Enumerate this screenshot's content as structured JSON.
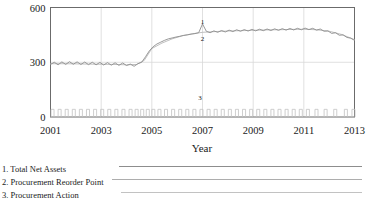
{
  "chart_data": {
    "type": "line",
    "title": "",
    "xlabel": "Year",
    "ylabel": "",
    "xlim": [
      2001,
      2013
    ],
    "ylim": [
      0,
      600
    ],
    "ytick_labels": [
      "600",
      "300",
      "0"
    ],
    "ytick_values": [
      600,
      300,
      0
    ],
    "xtick_labels": [
      "2001",
      "2003",
      "2005",
      "2007",
      "2009",
      "2011",
      "2013"
    ],
    "xtick_values": [
      2001,
      2003,
      2005,
      2007,
      2009,
      2011,
      2013
    ],
    "grid": true,
    "legend_position": "below-plot",
    "annotations": [
      {
        "text": "1",
        "x": 2007.0,
        "y": 510
      },
      {
        "text": "2",
        "x": 2007.0,
        "y": 418
      },
      {
        "text": "3",
        "x": 2006.9,
        "y": 92
      }
    ],
    "series": [
      {
        "name": "Total Net Assets",
        "legend_index": "1",
        "color": "#8d8d8d",
        "x": [
          2001.0,
          2001.15,
          2001.3,
          2001.45,
          2001.6,
          2001.75,
          2001.9,
          2002.05,
          2002.2,
          2002.35,
          2002.5,
          2002.65,
          2002.8,
          2002.95,
          2003.1,
          2003.25,
          2003.4,
          2003.55,
          2003.7,
          2003.85,
          2004.0,
          2004.15,
          2004.3,
          2004.45,
          2004.6,
          2004.75,
          2004.9,
          2005.05,
          2005.2,
          2005.35,
          2005.5,
          2005.65,
          2005.8,
          2005.95,
          2006.1,
          2006.25,
          2006.4,
          2006.55,
          2006.7,
          2006.85,
          2007.0,
          2007.15,
          2007.3,
          2007.45,
          2007.6,
          2007.75,
          2007.9,
          2008.05,
          2008.2,
          2008.35,
          2008.5,
          2008.65,
          2008.8,
          2008.95,
          2009.1,
          2009.25,
          2009.4,
          2009.55,
          2009.7,
          2009.85,
          2010.0,
          2010.15,
          2010.3,
          2010.45,
          2010.6,
          2010.75,
          2010.9,
          2011.05,
          2011.2,
          2011.35,
          2011.5,
          2011.65,
          2011.8,
          2011.95,
          2012.1,
          2012.25,
          2012.4,
          2012.55,
          2012.7,
          2012.85,
          2013.0
        ],
        "y": [
          288,
          300,
          286,
          302,
          288,
          303,
          289,
          302,
          288,
          301,
          287,
          300,
          286,
          299,
          285,
          298,
          284,
          297,
          283,
          296,
          282,
          290,
          278,
          292,
          300,
          330,
          362,
          385,
          400,
          410,
          420,
          428,
          433,
          438,
          442,
          447,
          450,
          454,
          457,
          462,
          510,
          470,
          462,
          472,
          464,
          474,
          466,
          476,
          468,
          478,
          470,
          479,
          471,
          480,
          472,
          481,
          473,
          482,
          474,
          483,
          475,
          484,
          476,
          485,
          477,
          486,
          478,
          487,
          479,
          486,
          476,
          482,
          470,
          472,
          458,
          462,
          448,
          450,
          436,
          432,
          420
        ]
      },
      {
        "name": "Procurement Reorder Point",
        "legend_index": "2",
        "color": "#b0b0b0",
        "x": [
          2001.0,
          2001.5,
          2002.0,
          2002.5,
          2003.0,
          2003.5,
          2004.0,
          2004.4,
          2004.7,
          2005.0,
          2005.4,
          2005.8,
          2006.2,
          2006.6,
          2007.0,
          2007.5,
          2008.0,
          2008.5,
          2009.0,
          2009.5,
          2010.0,
          2010.5,
          2011.0,
          2011.5,
          2012.0,
          2012.5,
          2013.0
        ],
        "y": [
          292,
          292,
          291,
          290,
          289,
          288,
          286,
          288,
          310,
          375,
          405,
          428,
          445,
          456,
          464,
          468,
          471,
          473,
          475,
          477,
          478,
          480,
          481,
          478,
          470,
          452,
          424
        ]
      },
      {
        "name": "Procurement Action",
        "legend_index": "3",
        "color": "#c2c2c2",
        "kind": "pulses",
        "baseline": 0,
        "pulse_height": 42,
        "pulse_width_years": 0.12,
        "x": [
          2001.08,
          2001.36,
          2001.64,
          2001.92,
          2002.2,
          2002.48,
          2002.76,
          2003.04,
          2003.32,
          2003.6,
          2003.88,
          2004.16,
          2004.4,
          2004.62,
          2004.84,
          2005.06,
          2005.3,
          2005.56,
          2005.84,
          2006.12,
          2006.4,
          2006.68,
          2006.96,
          2007.24,
          2007.52,
          2007.8,
          2008.08,
          2008.36,
          2008.64,
          2008.92,
          2009.2,
          2009.48,
          2009.76,
          2010.04,
          2010.32,
          2010.6,
          2010.88,
          2011.16,
          2011.5,
          2011.86,
          2012.24,
          2012.66,
          2012.96
        ]
      }
    ]
  },
  "legend": {
    "items": [
      {
        "label": "1. Total Net Assets"
      },
      {
        "label": "2. Procurement Reorder Point"
      },
      {
        "label": "3. Procurement Action"
      }
    ]
  },
  "colors": {
    "axis": "#6b6b6b",
    "grid": "#d8d8d8",
    "series1": "#8d8d8d",
    "series2": "#b0b0b0",
    "series3": "#c2c2c2",
    "text": "#1a1a1a"
  }
}
